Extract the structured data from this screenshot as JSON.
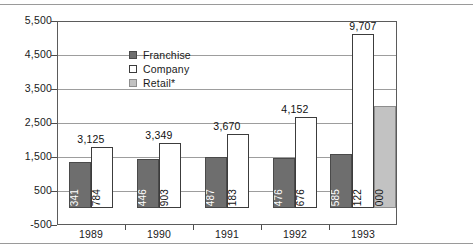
{
  "chart_data": {
    "type": "bar",
    "title": "",
    "xlabel": "",
    "ylabel": "",
    "categories": [
      "1989",
      "1990",
      "1991",
      "1992",
      "1993"
    ],
    "ylim": [
      -500,
      5500
    ],
    "yticks": [
      "-500",
      "500",
      "1,500",
      "2,500",
      "3,500",
      "4,500",
      "5,500"
    ],
    "ytick_values": [
      -500,
      500,
      1500,
      2500,
      3500,
      4500,
      5500
    ],
    "grid": true,
    "legend_position": "upper-left-inside",
    "series": [
      {
        "name": "Franchise",
        "color": "#6e6e6e",
        "values": [
          1341,
          1446,
          1487,
          1476,
          1585
        ],
        "labels": [
          "1,341",
          "1,446",
          "1,487",
          "1,476",
          "1,585"
        ]
      },
      {
        "name": "Company",
        "color": "#ffffff",
        "values": [
          1784,
          1903,
          2183,
          2676,
          5122
        ],
        "labels": [
          "1,784",
          "1,903",
          "2,183",
          "2,676",
          "5,122"
        ]
      },
      {
        "name": "Retail*",
        "color": "#c2c2c2",
        "values": [
          null,
          null,
          null,
          null,
          3000
        ],
        "labels": [
          "",
          "",
          "",
          "",
          "3,000"
        ]
      }
    ],
    "group_totals": [
      3125,
      3349,
      3670,
      4152,
      9707
    ],
    "group_total_labels": [
      "3,125",
      "3,349",
      "3,670",
      "4,152",
      "9,707"
    ]
  },
  "legend": {
    "items": [
      {
        "label": "Franchise",
        "swatch": "franchise"
      },
      {
        "label": "Company",
        "swatch": "company"
      },
      {
        "label": "Retail*",
        "swatch": "retail"
      }
    ]
  }
}
